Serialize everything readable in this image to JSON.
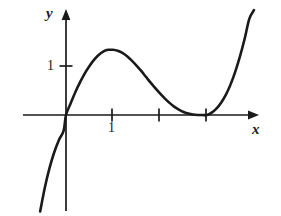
{
  "figure": {
    "kind": "cartesian-graph",
    "background_color": "#ffffff",
    "ink_color": "#1a1a1a",
    "width": 281,
    "height": 216
  },
  "axes": {
    "x_label": "x",
    "y_label": "y",
    "origin_px": {
      "x": 66,
      "y": 115
    },
    "x_unit_px": 47,
    "y_unit_px": 49,
    "x_axis_start_px": 23,
    "x_axis_end_px": 259,
    "y_axis_top_px": 10,
    "y_axis_bottom_px": 211,
    "arrow_heads": [
      "x-positive",
      "y-positive"
    ]
  },
  "ticks": {
    "x": [
      {
        "value": 1,
        "label": "1",
        "px": 112
      },
      {
        "value": 2,
        "label": "",
        "px": 159
      },
      {
        "value": 3,
        "label": "",
        "px": 206
      }
    ],
    "y": [
      {
        "value": 1,
        "label": "1",
        "px": 66
      }
    ]
  },
  "chart_data": {
    "type": "line",
    "title": "",
    "subtitle": "",
    "xlabel": "x",
    "ylabel": "y",
    "grid": false,
    "legend": null,
    "xlim": [
      -0.92,
      4.1
    ],
    "ylim": [
      -2.06,
      2.14
    ],
    "x_ticks": [
      1,
      2,
      3
    ],
    "x_tick_labels": [
      "1",
      "",
      ""
    ],
    "y_ticks": [
      1
    ],
    "y_tick_labels": [
      "1"
    ],
    "series": [
      {
        "name": "cubic curve",
        "color": "#1a1a1a",
        "line_width": 2.6,
        "roots": [
          0,
          3
        ],
        "local_maximum": {
          "x": 1.0,
          "y": 1.33
        },
        "local_minimum": {
          "x": 3.0,
          "y": 0.0
        },
        "x": [
          -0.55,
          -0.45,
          -0.35,
          -0.25,
          -0.15,
          -0.05,
          0.0,
          0.1,
          0.2,
          0.3,
          0.4,
          0.5,
          0.6,
          0.7,
          0.8,
          0.9,
          1.0,
          1.1,
          1.2,
          1.3,
          1.4,
          1.5,
          1.6,
          1.7,
          1.8,
          1.9,
          2.0,
          2.1,
          2.2,
          2.3,
          2.4,
          2.5,
          2.6,
          2.7,
          2.8,
          2.9,
          3.0,
          3.1,
          3.2,
          3.3,
          3.4,
          3.5,
          3.6,
          3.7,
          3.8,
          3.9,
          4.0
        ],
        "y": [
          -1.97,
          -1.48,
          -1.08,
          -0.76,
          -0.51,
          -0.32,
          0.0,
          0.24,
          0.47,
          0.67,
          0.85,
          1.0,
          1.13,
          1.23,
          1.3,
          1.33,
          1.33,
          1.31,
          1.27,
          1.2,
          1.11,
          1.01,
          0.9,
          0.78,
          0.66,
          0.55,
          0.44,
          0.34,
          0.25,
          0.17,
          0.11,
          0.06,
          0.03,
          0.01,
          0.0,
          0.0,
          0.0,
          0.05,
          0.13,
          0.25,
          0.41,
          0.62,
          0.88,
          1.19,
          1.55,
          1.96,
          2.14
        ]
      }
    ],
    "annotations": []
  }
}
